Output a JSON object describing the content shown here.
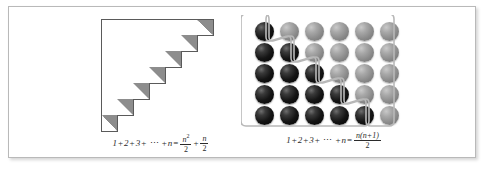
{
  "figure": {
    "panels": [
      {
        "id": "grid-staircase",
        "kind": "square-grid-half",
        "rows": 7,
        "cols": 7,
        "cell_px": 16,
        "diagonal_fill": "upper-right triangle",
        "colors": {
          "grid_line": "#5a5a5a",
          "triangle_fill": "#8d8d8d",
          "cell_background": "#ffffff"
        },
        "formula": {
          "lhs_terms": [
            "1",
            "+",
            "2",
            "+",
            "3",
            "+",
            "⋯",
            "+",
            "n"
          ],
          "equals": "=",
          "rhs": [
            {
              "type": "fraction",
              "numerator": "n²",
              "denominator": "2"
            },
            {
              "type": "operator",
              "text": "+"
            },
            {
              "type": "fraction",
              "numerator": "n",
              "denominator": "2"
            }
          ],
          "plain_text": "1+2+3+ ⋯ +n = n²/2 + n/2"
        }
      },
      {
        "id": "sphere-staircase",
        "kind": "sphere-grid",
        "rows": 5,
        "cols": 6,
        "sphere_px": 19,
        "dark_counts_per_row": [
          1,
          2,
          3,
          4,
          5
        ],
        "light_counts_per_row": [
          5,
          4,
          3,
          2,
          1
        ],
        "colors": {
          "dark_sphere": "#101010",
          "light_sphere": "#8a8a8a",
          "outline": "#b8b8b8"
        },
        "formula": {
          "lhs_terms": [
            "1",
            "+",
            "2",
            "+",
            "3",
            "+",
            "⋯",
            "+",
            "n"
          ],
          "equals": "=",
          "rhs": [
            {
              "type": "fraction",
              "numerator": "n(n+1)",
              "denominator": "2"
            }
          ],
          "plain_text": "1+2+3+ ⋯ +n = n(n+1)/2"
        }
      }
    ],
    "frame": {
      "border_color": "#b9b9b9",
      "background": "#ffffff"
    }
  },
  "left_formula": {
    "t1": "1",
    "p1": "+",
    "t2": "2",
    "p2": "+",
    "t3": "3",
    "p3": "+",
    "dots": "⋯",
    "p4": "+",
    "tn": "n",
    "eq": "=",
    "num1": "n",
    "exp1": "2",
    "den1": "2",
    "plus": "+",
    "num2": "n",
    "den2": "2"
  },
  "right_formula": {
    "t1": "1",
    "p1": "+",
    "t2": "2",
    "p2": "+",
    "t3": "3",
    "p3": "+",
    "dots": "⋯",
    "p4": "+",
    "tn": "n",
    "eq": "=",
    "num": "n(n+1)",
    "den": "2"
  }
}
